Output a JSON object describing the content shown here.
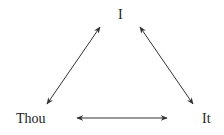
{
  "diagram": {
    "type": "triangle-relationship",
    "nodes": {
      "top": "I",
      "left": "Thou",
      "right": "It"
    },
    "edges": [
      {
        "from": "I",
        "to": "Thou",
        "style": "bidirectional-arrow"
      },
      {
        "from": "I",
        "to": "It",
        "style": "bidirectional-arrow"
      },
      {
        "from": "Thou",
        "to": "It",
        "style": "bidirectional-arrow"
      }
    ],
    "colors": {
      "line": "#333333",
      "text": "#222222",
      "background": "#ffffff"
    }
  }
}
